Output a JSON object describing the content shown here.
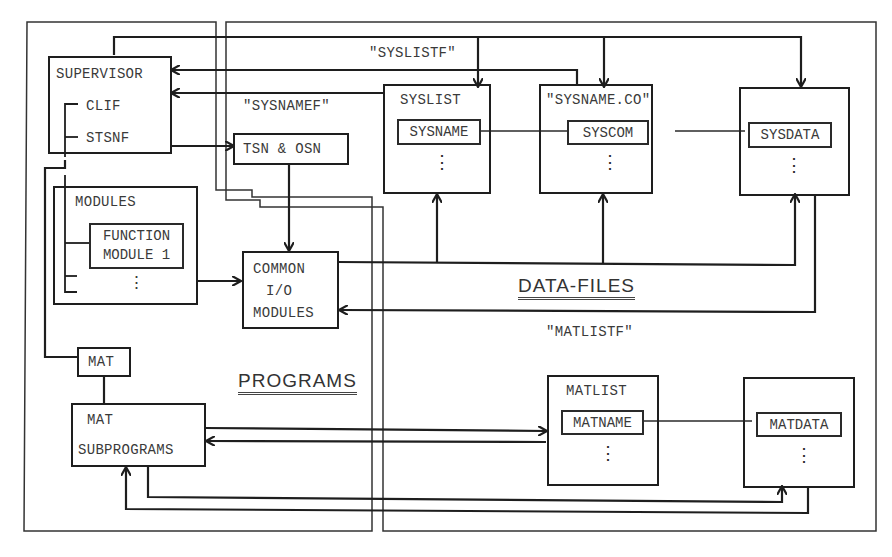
{
  "regions": {
    "programs": {
      "title": "PROGRAMS"
    },
    "data_files": {
      "title": "DATA-FILES"
    }
  },
  "file_labels": {
    "syslistf": "\"SYSLISTF\"",
    "sysnamef": "\"SYSNAMEF\"",
    "matlistf": "\"MATLISTF\""
  },
  "programs": {
    "supervisor": {
      "title": "SUPERVISOR",
      "items": [
        "CLIF",
        "STSNF"
      ]
    },
    "tsn_osn": {
      "label": "TSN & OSN"
    },
    "modules": {
      "title": "MODULES",
      "function_module": [
        "FUNCTION",
        "MODULE 1"
      ],
      "more": "⋮"
    },
    "common_io": {
      "lines": [
        "COMMON",
        "I/O",
        "MODULES"
      ]
    },
    "mat": {
      "label": "MAT"
    },
    "mat_subprograms": {
      "lines": [
        "MAT",
        "SUBPROGRAMS"
      ]
    }
  },
  "data_files": {
    "syslist": {
      "title": "SYSLIST",
      "field": "SYSNAME",
      "more": "⋮"
    },
    "sysname_co": {
      "title": "\"SYSNAME.CO\"",
      "field": "SYSCOM",
      "more": "⋮"
    },
    "sysdata": {
      "title": "",
      "field": "SYSDATA",
      "more": "⋮"
    },
    "matlist": {
      "title": "MATLIST",
      "field": "MATNAME",
      "more": "⋮"
    },
    "matdata": {
      "title": "",
      "field": "MATDATA",
      "more": "⋮"
    }
  },
  "colors": {
    "line": "#1e1e1e",
    "frame": "#333333",
    "text": "#3a3a3a",
    "background": "#ffffff"
  }
}
